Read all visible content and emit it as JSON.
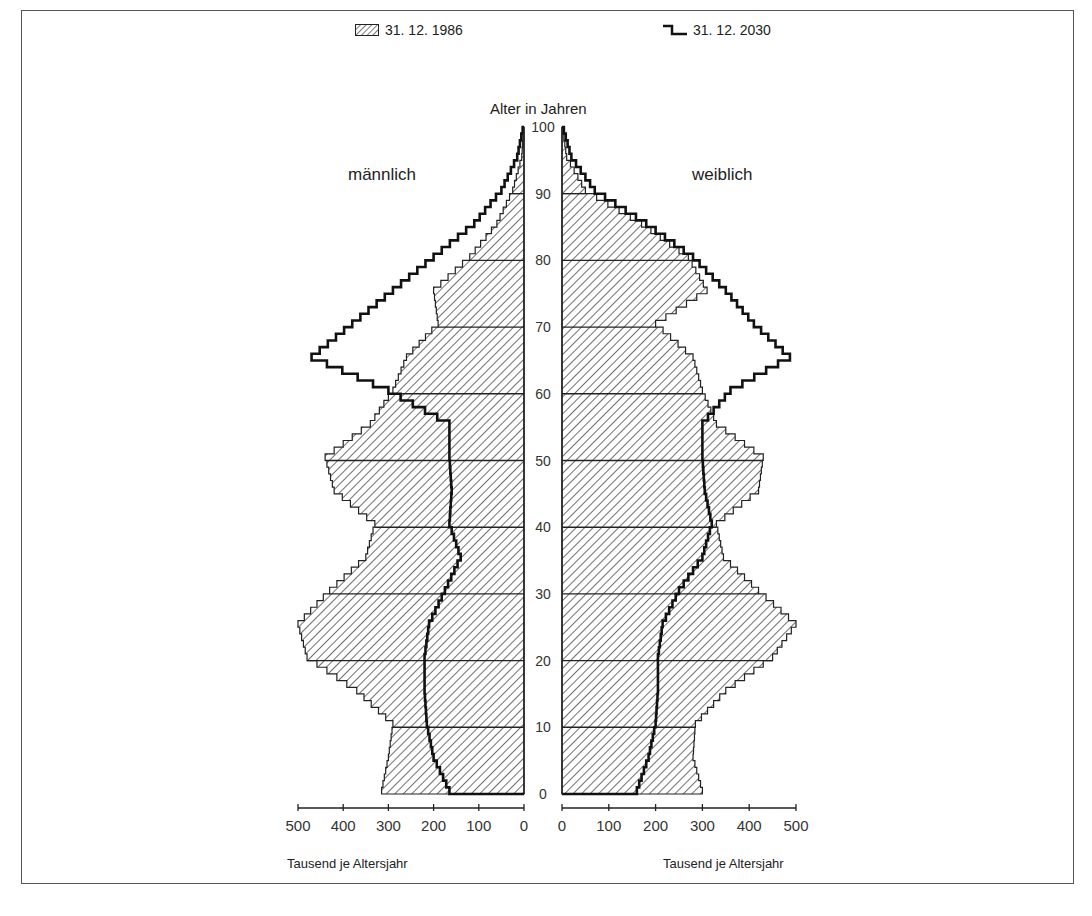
{
  "legend": {
    "series_1986": "31. 12. 1986",
    "series_2030": "31. 12. 2030"
  },
  "labels": {
    "y_axis_title": "Alter in Jahren",
    "male": "männlich",
    "female": "weiblich",
    "x_unit_left": "Tausend je Altersjahr",
    "x_unit_right": "Tausend je Altersjahr"
  },
  "chart_data": {
    "type": "bar",
    "subtype": "population-pyramid",
    "title": "",
    "ylabel": "Alter in Jahren",
    "xlabel": "Tausend je Altersjahr",
    "y_ticks": [
      0,
      10,
      20,
      30,
      40,
      50,
      60,
      70,
      80,
      90,
      100
    ],
    "x_ticks_left": [
      500,
      400,
      300,
      200,
      100,
      0
    ],
    "x_ticks_right": [
      0,
      100,
      200,
      300,
      400,
      500
    ],
    "xlim": [
      0,
      500
    ],
    "ylim": [
      0,
      100
    ],
    "legend": [
      "31. 12. 1986",
      "31. 12. 2030"
    ],
    "age_groups_step": 5,
    "ages": [
      0,
      5,
      10,
      15,
      20,
      25,
      30,
      35,
      40,
      45,
      50,
      55,
      60,
      65,
      70,
      75,
      80,
      85,
      90,
      95,
      100
    ],
    "series": [
      {
        "name": "31. 12. 1986 männlich",
        "style": "hatched",
        "values": [
          315,
          300,
          290,
          370,
          480,
          500,
          430,
          350,
          330,
          420,
          440,
          340,
          290,
          260,
          190,
          200,
          120,
          60,
          25,
          5,
          0
        ]
      },
      {
        "name": "31. 12. 1986 weiblich",
        "style": "hatched",
        "values": [
          300,
          280,
          285,
          350,
          450,
          500,
          420,
          345,
          330,
          420,
          430,
          330,
          300,
          280,
          200,
          310,
          270,
          170,
          50,
          10,
          0
        ]
      },
      {
        "name": "31. 12. 2030 männlich",
        "style": "step-line",
        "values": [
          165,
          200,
          215,
          220,
          220,
          210,
          175,
          140,
          165,
          160,
          165,
          165,
          300,
          470,
          380,
          290,
          200,
          110,
          50,
          15,
          0
        ]
      },
      {
        "name": "31. 12. 2030 weiblich",
        "style": "step-line",
        "values": [
          160,
          185,
          200,
          205,
          205,
          215,
          250,
          300,
          320,
          305,
          300,
          300,
          360,
          487,
          410,
          350,
          280,
          180,
          70,
          20,
          0
        ]
      }
    ]
  }
}
